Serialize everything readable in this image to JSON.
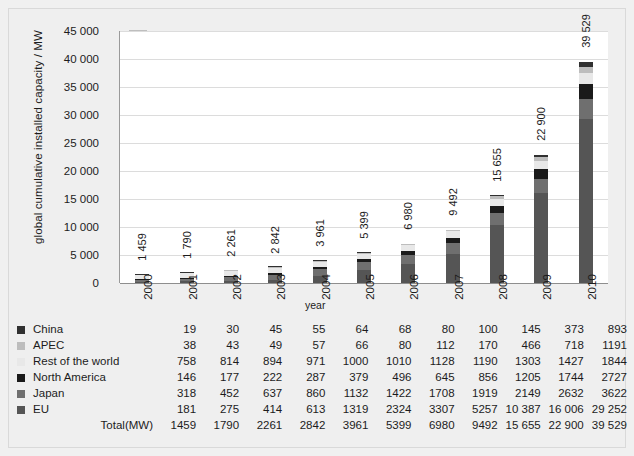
{
  "chart_data": {
    "type": "bar",
    "subtype": "stacked-bar",
    "title": "",
    "xlabel": "year",
    "ylabel": "global cumulative installed capacity / MW",
    "ylim": [
      0,
      45000
    ],
    "ytick_step": 5000,
    "grid": true,
    "legend_position": "bottom-table",
    "categories": [
      "2000",
      "2001",
      "2002",
      "2003",
      "2004",
      "2005",
      "2006",
      "2007",
      "2008",
      "2009",
      "2010"
    ],
    "ytick_labels": [
      "0",
      "5 000",
      "10 000",
      "15 000",
      "20 000",
      "25 000",
      "30 000",
      "35 000",
      "40 000",
      "45 000"
    ],
    "series": [
      {
        "name": "EU",
        "color": "#555555",
        "values": [
          181,
          275,
          414,
          613,
          1319,
          2324,
          3307,
          5257,
          10387,
          16006,
          29252
        ]
      },
      {
        "name": "Japan",
        "color": "#6f6f6f",
        "values": [
          318,
          452,
          637,
          860,
          1132,
          1422,
          1708,
          1919,
          2149,
          2632,
          3622
        ]
      },
      {
        "name": "North America",
        "color": "#1a1a1a",
        "values": [
          146,
          177,
          222,
          287,
          379,
          496,
          645,
          856,
          1205,
          1744,
          2727
        ]
      },
      {
        "name": "Rest of the world",
        "color": "#e8e8e8",
        "values": [
          758,
          814,
          894,
          971,
          1000,
          1010,
          1128,
          1190,
          1303,
          1427,
          1844
        ]
      },
      {
        "name": "APEC",
        "color": "#bdbdbd",
        "values": [
          38,
          43,
          49,
          57,
          66,
          80,
          112,
          170,
          466,
          718,
          1191
        ]
      },
      {
        "name": "China",
        "color": "#303030",
        "values": [
          19,
          30,
          45,
          55,
          64,
          68,
          80,
          100,
          145,
          373,
          893
        ]
      }
    ],
    "totals": [
      1459,
      1790,
      2261,
      2842,
      3961,
      5399,
      6980,
      9492,
      15655,
      22900,
      39529
    ],
    "bar_labels": [
      "1 459",
      "1 790",
      "2 261",
      "2 842",
      "3 961",
      "5 399",
      "6 980",
      "9 492",
      "15 655",
      "22 900",
      "39 529"
    ]
  },
  "legend_table": {
    "rows": [
      {
        "label": "China",
        "swatch": "#303030",
        "has_swatch": true,
        "values": [
          "19",
          "30",
          "45",
          "55",
          "64",
          "68",
          "80",
          "100",
          "145",
          "373",
          "893"
        ]
      },
      {
        "label": "APEC",
        "swatch": "#bdbdbd",
        "has_swatch": true,
        "values": [
          "38",
          "43",
          "49",
          "57",
          "66",
          "80",
          "112",
          "170",
          "466",
          "718",
          "1191"
        ]
      },
      {
        "label": "Rest of the world",
        "swatch": "#e8e8e8",
        "has_swatch": true,
        "values": [
          "758",
          "814",
          "894",
          "971",
          "1000",
          "1010",
          "1128",
          "1190",
          "1303",
          "1427",
          "1844"
        ]
      },
      {
        "label": "North America",
        "swatch": "#1a1a1a",
        "has_swatch": true,
        "values": [
          "146",
          "177",
          "222",
          "287",
          "379",
          "496",
          "645",
          "856",
          "1205",
          "1744",
          "2727"
        ]
      },
      {
        "label": "Japan",
        "swatch": "#6f6f6f",
        "has_swatch": true,
        "values": [
          "318",
          "452",
          "637",
          "860",
          "1132",
          "1422",
          "1708",
          "1919",
          "2149",
          "2632",
          "3622"
        ]
      },
      {
        "label": "EU",
        "swatch": "#555555",
        "has_swatch": true,
        "values": [
          "181",
          "275",
          "414",
          "613",
          "1319",
          "2324",
          "3307",
          "5257",
          "10 387",
          "16 006",
          "29 252"
        ]
      }
    ],
    "total_label": "Total(MW)",
    "total_values": [
      "1459",
      "1790",
      "2261",
      "2842",
      "3961",
      "5399",
      "6980",
      "9492",
      "15 655",
      "22 900",
      "39 529"
    ]
  }
}
